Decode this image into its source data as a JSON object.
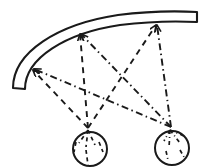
{
  "figure": {
    "canvas": {
      "width": 208,
      "height": 167,
      "background": "#ffffff"
    },
    "stroke_color": "#1a1a1a",
    "ink_color": "#1a1a1a",
    "elements": {
      "arc": {
        "name": "curved-reflector-band",
        "description": "thick curved band arcing from lower-left up to upper-right, drawn as two concentric arcs closed by flat end caps",
        "outer_path": "M 13 88 C 13 52, 58 24, 118 15 C 150 11, 178 11, 197 12",
        "inner_path": "M 25 89 C 25 58, 66 33, 120 25 C 152 21, 178 21, 197 22",
        "cap_left": "M 13 88 L 25 89",
        "cap_right": "M 197 12 L 197 22",
        "stroke_width": 2.1,
        "fill": "#ffffff"
      },
      "circles": [
        {
          "name": "source-circle-left",
          "cx": 90,
          "cy": 149,
          "r": 17,
          "vertex_x": 88,
          "vertex_y": 128,
          "line_style": "dashed",
          "stroke_width": 2.0,
          "hatch_count": 5
        },
        {
          "name": "source-circle-right",
          "cx": 172,
          "cy": 148,
          "r": 17,
          "vertex_x": 171,
          "vertex_y": 127,
          "line_style": "dash-dot",
          "stroke_width": 2.0,
          "hatch_count": 5
        }
      ],
      "arrow_targets": [
        {
          "name": "arrow-target-left",
          "x": 31,
          "y": 68,
          "angle_deg": 214
        },
        {
          "name": "arrow-target-middle",
          "x": 80,
          "y": 31,
          "angle_deg": 268
        },
        {
          "name": "arrow-target-right",
          "x": 157,
          "y": 22,
          "angle_deg": 272
        }
      ],
      "rays": [
        {
          "name": "ray-left-circle-to-left-target",
          "style": "dashed",
          "from": "source-circle-left",
          "to": "arrow-target-left",
          "x1": 88,
          "y1": 128,
          "x2": 33,
          "y2": 70
        },
        {
          "name": "ray-left-circle-to-middle-target",
          "style": "dashed",
          "from": "source-circle-left",
          "to": "arrow-target-middle",
          "x1": 88,
          "y1": 128,
          "x2": 80,
          "y2": 34
        },
        {
          "name": "ray-left-circle-to-right-target",
          "style": "dashed",
          "from": "source-circle-left",
          "to": "arrow-target-right",
          "x1": 88,
          "y1": 128,
          "x2": 156,
          "y2": 25
        },
        {
          "name": "ray-right-circle-to-left-target",
          "style": "dash-dot",
          "from": "source-circle-right",
          "to": "arrow-target-left",
          "x1": 171,
          "y1": 127,
          "x2": 34,
          "y2": 69
        },
        {
          "name": "ray-right-circle-to-middle-target",
          "style": "dash-dot",
          "from": "source-circle-right",
          "to": "arrow-target-middle",
          "x1": 171,
          "y1": 127,
          "x2": 81,
          "y2": 34
        },
        {
          "name": "ray-right-circle-to-right-target",
          "style": "dash-dot",
          "from": "source-circle-right",
          "to": "arrow-target-right",
          "x1": 171,
          "y1": 127,
          "x2": 157,
          "y2": 25
        }
      ],
      "left_circle_hatches": [
        {
          "x1": 88,
          "y1": 130,
          "x2": 79,
          "y2": 143
        },
        {
          "x1": 88,
          "y1": 130,
          "x2": 86,
          "y2": 147
        },
        {
          "x1": 88,
          "y1": 130,
          "x2": 95,
          "y2": 145
        },
        {
          "x1": 86,
          "y1": 150,
          "x2": 88,
          "y2": 165
        },
        {
          "x1": 76,
          "y1": 142,
          "x2": 74,
          "y2": 152
        },
        {
          "x1": 99,
          "y1": 142,
          "x2": 103,
          "y2": 152
        }
      ],
      "right_circle_hatches": [
        {
          "x1": 170,
          "y1": 130,
          "x2": 164,
          "y2": 141
        },
        {
          "x1": 170,
          "y1": 130,
          "x2": 169,
          "y2": 148
        },
        {
          "x1": 170,
          "y1": 130,
          "x2": 180,
          "y2": 143
        },
        {
          "x1": 170,
          "y1": 130,
          "x2": 184,
          "y2": 136
        },
        {
          "x1": 166,
          "y1": 151,
          "x2": 168,
          "y2": 160
        },
        {
          "x1": 180,
          "y1": 150,
          "x2": 184,
          "y2": 157
        }
      ],
      "dash_patterns": {
        "dashed": "6 5",
        "dash_dot": "7 3.5 1.5 3.5",
        "hatch_dashed": "4 3.5",
        "hatch_dash_dot": "4 3 1 3"
      }
    }
  }
}
